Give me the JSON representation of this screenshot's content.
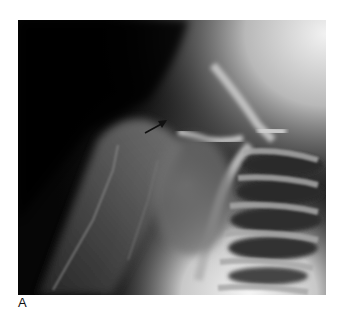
{
  "figure": {
    "type": "radiograph",
    "panel_label": "A",
    "annotation": {
      "kind": "arrow",
      "color": "#111111",
      "from": [
        145,
        133
      ],
      "to": [
        167,
        121
      ]
    },
    "colors": {
      "background": "#ffffff",
      "dark_region": "#050505",
      "bright_region": "#e8e8e8"
    }
  }
}
